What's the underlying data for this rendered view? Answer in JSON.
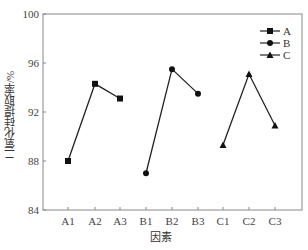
{
  "chart_data": {
    "type": "line",
    "title": "",
    "xlabel": "因素",
    "ylabel": "二氧化硅提取率/%",
    "ylim": [
      84,
      100
    ],
    "yticks": [
      84,
      88,
      92,
      96,
      100
    ],
    "categories": [
      "A1",
      "A2",
      "A3",
      "B1",
      "B2",
      "B3",
      "C1",
      "C2",
      "C3"
    ],
    "grid": false,
    "legend_position": "upper right",
    "series": [
      {
        "name": "A",
        "marker": "square",
        "x": [
          "A1",
          "A2",
          "A3"
        ],
        "values": [
          88.0,
          94.3,
          93.1
        ]
      },
      {
        "name": "B",
        "marker": "circle",
        "x": [
          "B1",
          "B2",
          "B3"
        ],
        "values": [
          87.0,
          95.5,
          93.5
        ]
      },
      {
        "name": "C",
        "marker": "triangle",
        "x": [
          "C1",
          "C2",
          "C3"
        ],
        "values": [
          89.3,
          95.1,
          90.9
        ]
      }
    ]
  }
}
